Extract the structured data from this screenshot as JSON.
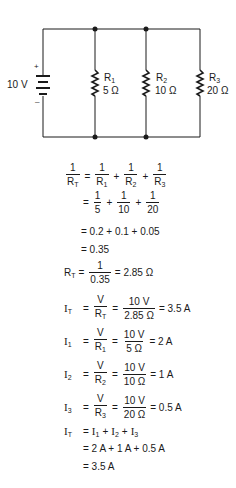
{
  "circuit": {
    "source": {
      "label": "10 V",
      "plus": "+",
      "minus": "–"
    },
    "resistors": [
      {
        "name": "R",
        "sub": "1",
        "value": "5 Ω"
      },
      {
        "name": "R",
        "sub": "2",
        "value": "10 Ω"
      },
      {
        "name": "R",
        "sub": "3",
        "value": "20 Ω"
      }
    ]
  },
  "equations": {
    "one": "1",
    "R": "R",
    "T": "T",
    "s1": "1",
    "s2": "2",
    "s3": "3",
    "eq": "=",
    "plus": "+",
    "d5": "5",
    "d10": "10",
    "d20": "20",
    "line3": "= 0.2 + 0.1 + 0.05",
    "line4": "= 0.35",
    "d035": "0.35",
    "rt_result": "= 2.85 Ω",
    "I": "I",
    "V": "V",
    "v10": "10 V",
    "d285": "2.85 Ω",
    "d5o": "5 Ω",
    "d10o": "10 Ω",
    "d20o": "20 Ω",
    "it_result": "= 3.5 A",
    "i1_result": "= 2 A",
    "i2_result": "= 1 A",
    "i3_result": "= 0.5 A",
    "sum_line2": "= 2 A + 1 A + 0.5 A",
    "sum_line3": "= 3.5 A"
  }
}
